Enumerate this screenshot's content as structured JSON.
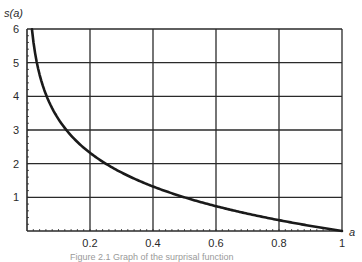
{
  "chart_data": {
    "type": "line",
    "title": "",
    "xlabel": "a",
    "ylabel": "s(a)",
    "xlim": [
      0,
      1
    ],
    "ylim": [
      0,
      6
    ],
    "grid": true,
    "legend": null,
    "x_ticks": [
      "0.2",
      "0.4",
      "0.6",
      "0.8",
      "1"
    ],
    "y_ticks": [
      "1",
      "2",
      "3",
      "4",
      "5",
      "6"
    ],
    "function": "s(a) = -log2(a)",
    "series": [
      {
        "name": "s(a)",
        "x": [
          0.016,
          0.03,
          0.05,
          0.0625,
          0.08,
          0.1,
          0.125,
          0.15,
          0.2,
          0.25,
          0.3,
          0.4,
          0.5,
          0.6,
          0.7,
          0.8,
          0.9,
          1.0
        ],
        "y": [
          5.97,
          5.06,
          4.32,
          4.0,
          3.64,
          3.32,
          3.0,
          2.74,
          2.32,
          2.0,
          1.74,
          1.32,
          1.0,
          0.74,
          0.51,
          0.32,
          0.15,
          0.0
        ]
      }
    ],
    "colors": {
      "line": "#1a1a1a",
      "grid": "#2a2a2a",
      "text": "#2a2a2a"
    }
  },
  "labels": {
    "y_axis": "s(a)",
    "x_axis": "a",
    "caption": "Figure 2.1  Graph of the surprisal function"
  }
}
